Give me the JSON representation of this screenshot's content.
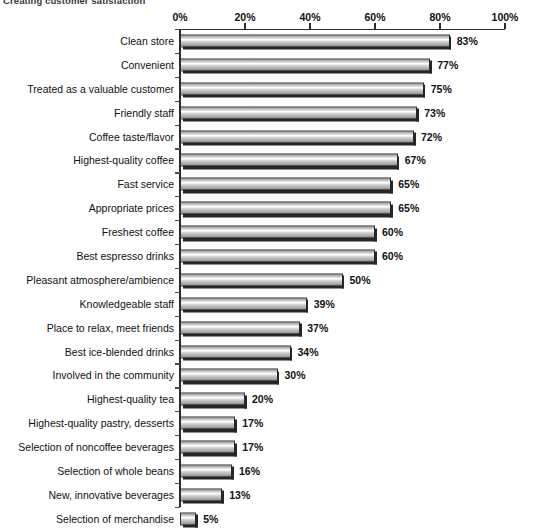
{
  "caption": {
    "text": "Creating customer satisfaction"
  },
  "chart_data": {
    "type": "bar",
    "orientation": "horizontal",
    "title": "Creating customer satisfaction",
    "xlabel": "",
    "ylabel": "",
    "xlim": [
      0,
      100
    ],
    "grid": false,
    "legend": null,
    "tick_labels": [
      "0%",
      "20%",
      "40%",
      "60%",
      "80%",
      "100%"
    ],
    "ticks": [
      0,
      20,
      40,
      60,
      80,
      100
    ],
    "value_suffix": "%",
    "categories": [
      "Clean store",
      "Convenient",
      "Treated as a valuable customer",
      "Friendly staff",
      "Coffee taste/flavor",
      "Highest-quality coffee",
      "Fast service",
      "Appropriate prices",
      "Freshest coffee",
      "Best espresso drinks",
      "Pleasant atmosphere/ambience",
      "Knowledgeable staff",
      "Place to relax, meet friends",
      "Best ice-blended drinks",
      "Involved in the community",
      "Highest-quality tea",
      "Highest-quality pastry, desserts",
      "Selection of noncoffee beverages",
      "Selection of whole beans",
      "New, innovative beverages",
      "Selection of merchandise"
    ],
    "values": [
      83,
      77,
      75,
      73,
      72,
      67,
      65,
      65,
      60,
      60,
      50,
      39,
      37,
      34,
      30,
      20,
      17,
      17,
      16,
      13,
      5
    ],
    "value_labels": [
      "83%",
      "77%",
      "75%",
      "73%",
      "72%",
      "67%",
      "65%",
      "65%",
      "60%",
      "60%",
      "50%",
      "39%",
      "37%",
      "34%",
      "30%",
      "20%",
      "17%",
      "17%",
      "16%",
      "13%",
      "5%"
    ],
    "colors": {
      "bar_light": "#ffffff",
      "bar_mid": "#c9c9c9",
      "bar_dark": "#8e8e8e",
      "bar_outline": "#2f2f2f",
      "bar_shadow": "#262626",
      "axis": "#2b2b2b",
      "text": "#111111",
      "background": "#ffffff"
    }
  }
}
